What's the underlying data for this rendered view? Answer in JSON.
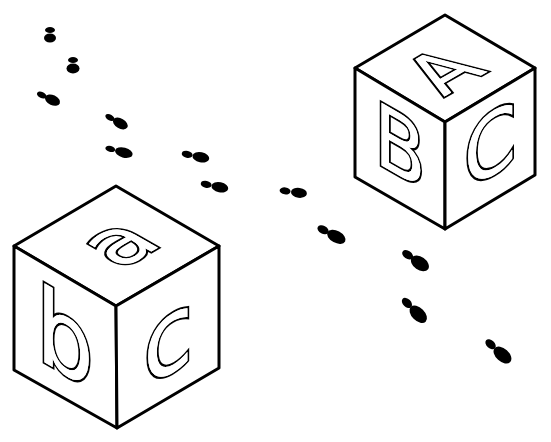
{
  "blocks": [
    {
      "name": "uppercase-block",
      "top_letter": "A",
      "left_letter": "B",
      "right_letter": "C"
    },
    {
      "name": "lowercase-block",
      "top_letter": "a",
      "left_letter": "b",
      "right_letter": "c"
    }
  ],
  "footprints": {
    "count": 12,
    "color": "#000000"
  },
  "colors": {
    "background": "#ffffff",
    "ink": "#000000"
  }
}
